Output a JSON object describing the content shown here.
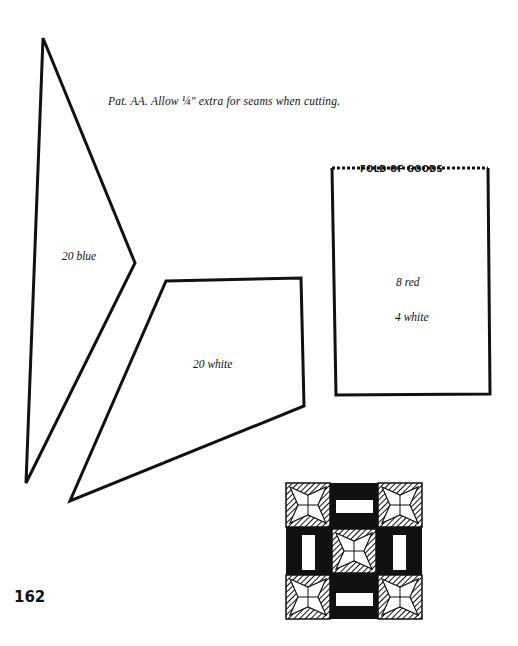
{
  "page": {
    "caption": "Pat. AA.  Allow ¼\" extra for seams when cutting.",
    "page_number": "162"
  },
  "pieces": [
    {
      "id": "triangle-piece",
      "label": "20 blue"
    },
    {
      "id": "quad-piece",
      "label": "20 white"
    },
    {
      "id": "rect-piece",
      "label_1": "8 red",
      "label_2": "4 white",
      "fold_label": "FOLD OF GOODS"
    }
  ],
  "block_illustration": {
    "name": "quilt-block-diagram"
  },
  "colors": {
    "ink": "#111111",
    "paper": "#ffffff"
  }
}
